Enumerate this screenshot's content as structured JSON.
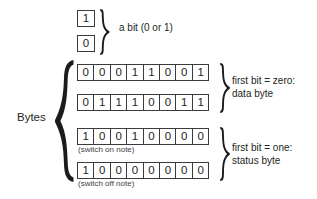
{
  "diagram": {
    "bit_group": {
      "bits": [
        "1",
        "0"
      ],
      "label": "a bit (0 or 1)",
      "brace": "right-curly-brace"
    },
    "bytes_group": {
      "label": "Bytes",
      "brace": "left-curly-brace",
      "rows": [
        {
          "name": "data-byte-1",
          "bits": [
            "0",
            "0",
            "0",
            "1",
            "1",
            "0",
            "0",
            "1"
          ],
          "caption": ""
        },
        {
          "name": "data-byte-2",
          "bits": [
            "0",
            "1",
            "1",
            "1",
            "0",
            "0",
            "1",
            "1"
          ],
          "caption": ""
        },
        {
          "name": "status-byte-1",
          "bits": [
            "1",
            "0",
            "0",
            "1",
            "0",
            "0",
            "0",
            "0"
          ],
          "caption": "(switch on note)"
        },
        {
          "name": "status-byte-2",
          "bits": [
            "1",
            "0",
            "0",
            "0",
            "0",
            "0",
            "0",
            "0"
          ],
          "caption": "(switch off note)"
        }
      ],
      "annotations": [
        {
          "name": "data-byte-annotation",
          "line1": "first bit = zero:",
          "line2": "data byte",
          "brace": "right-curly-brace"
        },
        {
          "name": "status-byte-annotation",
          "line1": "first bit = one:",
          "line2": "status byte",
          "brace": "right-curly-brace"
        }
      ]
    },
    "colors": {
      "background": "#ffffff",
      "ink": "#231f20",
      "cell_border": "#3b3b3b",
      "brace": "#1c1c1c",
      "caption": "#3f3f3f"
    }
  }
}
